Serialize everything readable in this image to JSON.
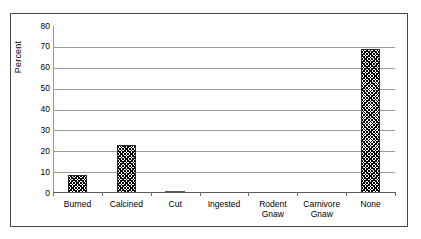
{
  "chart_data": {
    "type": "bar",
    "title": "",
    "subtitle": "",
    "xlabel": "",
    "ylabel": "Percent",
    "categories": [
      "Burned",
      "Calcined",
      "Cut",
      "Ingested",
      "Rodent Gnaw",
      "Carnivore\nGnaw",
      "None"
    ],
    "values": [
      8.5,
      23,
      1,
      0,
      0,
      0,
      69
    ],
    "ylim": [
      0,
      80
    ],
    "ytick_labels": [
      "0",
      "10",
      "20",
      "30",
      "40",
      "50",
      "60",
      "70",
      "80"
    ],
    "ytick_values": [
      0,
      10,
      20,
      30,
      40,
      50,
      60,
      70,
      80
    ],
    "grid": true,
    "grid_axis": "y",
    "legend": false,
    "legend_position": "none",
    "bar_fill": "diagonal-crosshatch",
    "colors": {
      "bar_edge": "#2a2a2a",
      "bar_fill": "#ffffff",
      "gridline": "#9a9a9a",
      "frame": "#4a4a4a",
      "text": "#000000",
      "background": "#ffffff"
    }
  },
  "figure": {
    "frame_name": "chart-outer-border"
  }
}
